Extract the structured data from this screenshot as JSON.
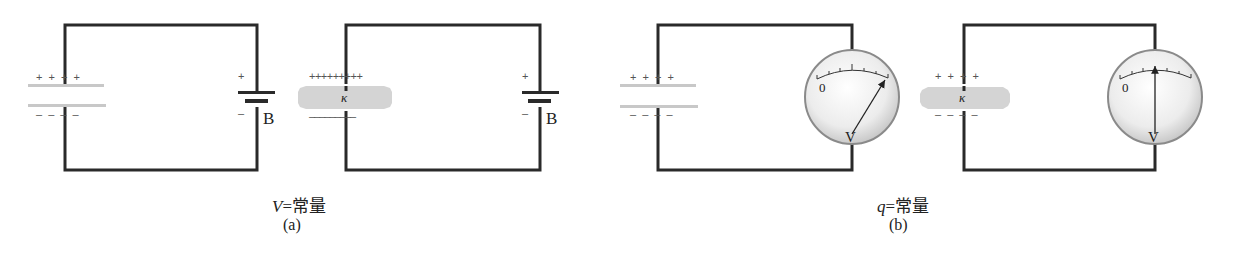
{
  "figure": {
    "panel_a": {
      "caption_var": "V",
      "caption_rest": "=常量",
      "label": "(a)",
      "circuit_1": {
        "plate_top_charges": "+ + + +",
        "plate_bottom_charges": "– – – –",
        "battery_plus": "+",
        "battery_minus": "–",
        "battery_label": "B"
      },
      "circuit_2": {
        "plate_top_charges": "+++++++++",
        "plate_bottom_charges": "–––––––––",
        "dielectric_label": "κ",
        "battery_plus": "+",
        "battery_minus": "–",
        "battery_label": "B"
      }
    },
    "panel_b": {
      "caption_var": "q",
      "caption_rest": "=常量",
      "label": "(b)",
      "circuit_1": {
        "plate_top_charges": "+ + + +",
        "plate_bottom_charges": "– – – –",
        "meter_zero": "0",
        "meter_label": "V"
      },
      "circuit_2": {
        "plate_top_charges": "+ + + +",
        "plate_bottom_charges": "– – – –",
        "dielectric_label": "κ",
        "meter_zero": "0",
        "meter_label": "V"
      }
    },
    "colors": {
      "wire": "#2a2a2a",
      "plate": "#c8c8c8",
      "dielectric": "#d4d4d4",
      "meter_face": "#eeeeee",
      "meter_rim": "#8a8a8a"
    }
  }
}
